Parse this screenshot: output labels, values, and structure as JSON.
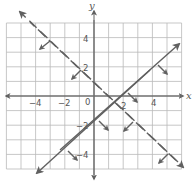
{
  "graph": {
    "axes": {
      "x_label": "x",
      "y_label": "y",
      "x_ticks": [
        {
          "value": -4,
          "label": "−4"
        },
        {
          "value": -2,
          "label": "−2"
        },
        {
          "value": 2,
          "label": "2"
        },
        {
          "value": 4,
          "label": "4"
        }
      ],
      "y_ticks": [
        {
          "value": 4,
          "label": "4"
        },
        {
          "value": 2,
          "label": "2"
        },
        {
          "value": -2,
          "label": "−2"
        },
        {
          "value": -4,
          "label": "−4"
        }
      ],
      "origin_label": "0"
    },
    "grid": {
      "x_min": -6,
      "x_max": 6,
      "y_min": -5,
      "y_max": 5,
      "step": 1
    },
    "lines": [
      {
        "name": "dashed-boundary",
        "equation": "y = -x + 1",
        "style": "dashed",
        "shade": "below",
        "inequality": "y < -x + 1"
      },
      {
        "name": "solid-boundary",
        "equation": "y = x - 2",
        "style": "solid",
        "shade": "below-right",
        "inequality": "y ≤ x - 2"
      }
    ],
    "colors": {
      "grid": "#b9b9b9",
      "axis": "#6f6f6f",
      "line": "#606060",
      "background": "#ffffff"
    }
  }
}
